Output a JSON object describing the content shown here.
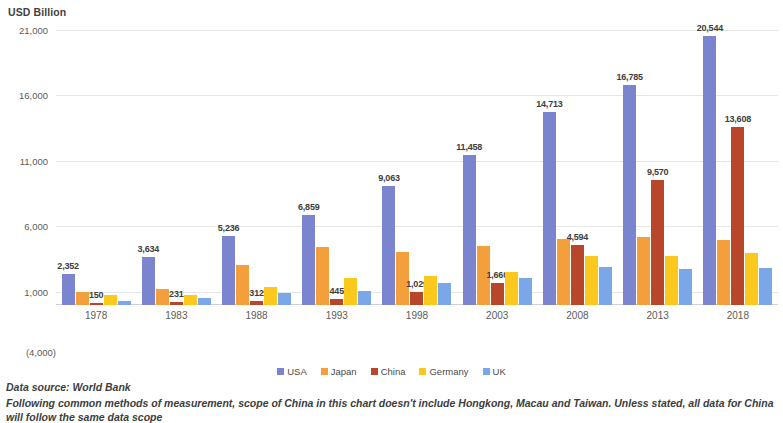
{
  "axis_unit_title": "USD Billion",
  "y_axis": {
    "ticks": [
      "21,000",
      "16,000",
      "11,000",
      "6,000",
      "1,000"
    ],
    "tick_values": [
      21000,
      16000,
      11000,
      6000,
      1000
    ],
    "negative_label": "(4,000)",
    "min": -4000,
    "max": 21000
  },
  "legend": {
    "items": [
      {
        "label": "USA",
        "color": "#7b84cf"
      },
      {
        "label": "Japan",
        "color": "#f3a03c"
      },
      {
        "label": "China",
        "color": "#b8462b"
      },
      {
        "label": "Germany",
        "color": "#fbc81e"
      },
      {
        "label": "UK",
        "color": "#7aa7e8"
      }
    ]
  },
  "footnotes": {
    "source": "Data source: World Bank",
    "note": "Following common methods of measurement, scope of China in this chart doesn't include Hongkong, Macau and Taiwan. Unless stated, all data for China will follow the same data scope"
  },
  "chart_data": {
    "type": "bar",
    "title": "",
    "xlabel": "",
    "ylabel": "USD Billion",
    "ylim": [
      -4000,
      21000
    ],
    "grid": true,
    "legend_position": "bottom",
    "categories": [
      "1978",
      "1983",
      "1988",
      "1993",
      "1998",
      "2003",
      "2008",
      "2013",
      "2018"
    ],
    "series": [
      {
        "name": "USA",
        "color": "#7b84cf",
        "values": [
          2352,
          3634,
          5236,
          6859,
          9063,
          11458,
          14713,
          16785,
          20544
        ],
        "labels": [
          "2,352",
          "3,634",
          "5,236",
          "6,859",
          "9,063",
          "11,458",
          "14,713",
          "16,785",
          "20,544"
        ]
      },
      {
        "name": "Japan",
        "color": "#f3a03c",
        "values": [
          1010,
          1243,
          3072,
          4454,
          4032,
          4519,
          5038,
          5156,
          4971
        ],
        "labels": [
          "",
          "",
          "",
          "",
          "",
          "",
          "",
          "",
          ""
        ]
      },
      {
        "name": "China",
        "color": "#b8462b",
        "values": [
          150,
          231,
          312,
          445,
          1029,
          1660,
          4594,
          9570,
          13608
        ],
        "labels": [
          "150",
          "231",
          "312",
          "445",
          "1,029",
          "1,660",
          "4,594",
          "9,570",
          "13,608"
        ]
      },
      {
        "name": "Germany",
        "color": "#fbc81e",
        "values": [
          741,
          771,
          1403,
          2074,
          2238,
          2512,
          3752,
          3752,
          3948
        ],
        "labels": [
          "",
          "",
          "",
          "",
          "",
          "",
          "",
          "",
          ""
        ]
      },
      {
        "name": "UK",
        "color": "#7aa7e8",
        "values": [
          344,
          500,
          910,
          1063,
          1655,
          2054,
          2929,
          2784,
          2855
        ],
        "labels": [
          "",
          "",
          "",
          "",
          "",
          "",
          "",
          "",
          ""
        ]
      }
    ]
  }
}
